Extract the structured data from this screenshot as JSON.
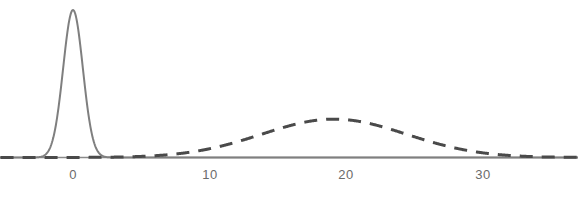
{
  "chart_data": {
    "type": "line",
    "title": "",
    "subtitle": "",
    "xlabel": "",
    "ylabel": "",
    "xlim": [
      -5.3,
      37.0
    ],
    "ylim": [
      0,
      1.06
    ],
    "grid": false,
    "legend": null,
    "axis": {
      "baseline_visible": true,
      "baseline_color": "#8a8a8a",
      "y_axis_visible": false,
      "x_ticks": [
        0,
        10,
        20,
        30
      ],
      "x_tick_labels": [
        "0",
        "10",
        "20",
        "30"
      ],
      "y_ticks": []
    },
    "series": [
      {
        "name": "narrow-distribution",
        "style": "solid",
        "color": "#7f7f7f",
        "line_width": 2,
        "distribution": "gaussian",
        "mean": 0,
        "sigma": 0.72,
        "peak_height": 1.0,
        "x": [
          -5.3,
          -4.0,
          -3.0,
          -2.5,
          -2.0,
          -1.75,
          -1.5,
          -1.25,
          -1.0,
          -0.75,
          -0.5,
          -0.25,
          0.0,
          0.25,
          0.5,
          0.75,
          1.0,
          1.25,
          1.5,
          1.75,
          2.0,
          2.5,
          3.0,
          4.0,
          6.0,
          10.0,
          15.0,
          20.0,
          25.0,
          30.0,
          37.0
        ],
        "y": [
          0.0,
          0.0,
          0.009,
          0.027,
          0.062,
          0.1,
          0.146,
          0.215,
          0.376,
          0.58,
          0.785,
          0.942,
          1.0,
          0.942,
          0.785,
          0.58,
          0.376,
          0.215,
          0.146,
          0.1,
          0.062,
          0.027,
          0.009,
          0.0,
          0.0,
          0.0,
          0.0,
          0.0,
          0.0,
          0.0,
          0.0
        ]
      },
      {
        "name": "broad-distribution",
        "style": "dashed",
        "color": "#4a4a4a",
        "line_width": 3,
        "dash_pattern": [
          13,
          9
        ],
        "distribution": "gaussian",
        "mean": 19.1,
        "sigma": 5.3,
        "peak_height": 0.26,
        "x": [
          -5.3,
          -2.0,
          0.0,
          3.0,
          6.0,
          8.0,
          10.0,
          11.0,
          12.0,
          13.0,
          14.0,
          15.0,
          16.0,
          17.0,
          18.0,
          19.1,
          20.0,
          21.0,
          22.0,
          23.0,
          24.0,
          25.0,
          26.0,
          27.0,
          28.0,
          29.0,
          30.0,
          32.0,
          34.0,
          37.0
        ],
        "y": [
          0.0,
          0.0,
          0.0,
          0.001,
          0.005,
          0.012,
          0.03,
          0.044,
          0.063,
          0.086,
          0.115,
          0.146,
          0.178,
          0.208,
          0.234,
          0.26,
          0.252,
          0.238,
          0.216,
          0.188,
          0.157,
          0.126,
          0.097,
          0.071,
          0.05,
          0.033,
          0.022,
          0.008,
          0.002,
          0.0
        ]
      }
    ]
  },
  "tick_labels": {
    "t0": "0",
    "t1": "10",
    "t2": "20",
    "t3": "30"
  }
}
